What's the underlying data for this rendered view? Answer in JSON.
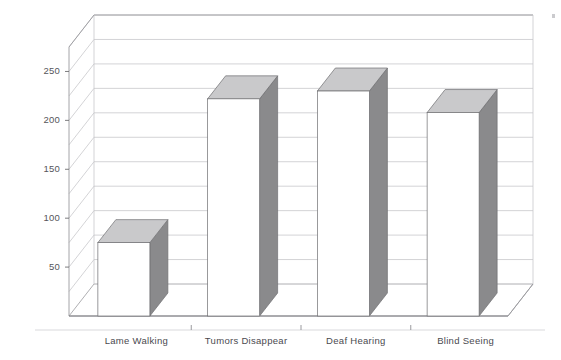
{
  "chart_data": {
    "type": "bar",
    "title": "",
    "xlabel": "",
    "ylabel": "",
    "categories": [
      "Lame Walking",
      "Tumors Disappear",
      "Deaf Hearing",
      "Blind Seeing"
    ],
    "values": [
      75,
      222,
      230,
      208
    ],
    "ylim": [
      0,
      275
    ],
    "yticks": [
      50,
      100,
      150,
      200,
      250
    ],
    "ytick_labels": [
      "50",
      "100",
      "150",
      "200",
      "250"
    ],
    "gridlines": [
      25,
      50,
      75,
      100,
      125,
      150,
      175,
      200,
      225,
      250,
      275
    ],
    "grid": true,
    "legend": "none",
    "style": "3d-column",
    "colors": {
      "bar_front": "#ffffff",
      "bar_top": "#c9c9cb",
      "bar_side": "#8a8a8c",
      "bar_outline": "#6e6e71",
      "grid": "#c8c8cc",
      "axis": "#9a9a9e",
      "floor": "#ffffff",
      "text": "#55555a"
    }
  },
  "axis": {
    "ticks": [
      {
        "label": "250",
        "value": 250
      },
      {
        "label": "200",
        "value": 200
      },
      {
        "label": "150",
        "value": 150
      },
      {
        "label": "100",
        "value": 100
      },
      {
        "label": "50",
        "value": 50
      }
    ]
  },
  "categories": [
    {
      "label": "Lame Walking",
      "value": 75
    },
    {
      "label": "Tumors Disappear",
      "value": 222
    },
    {
      "label": "Deaf Hearing",
      "value": 230
    },
    {
      "label": "Blind Seeing",
      "value": 208
    }
  ],
  "title": {
    "text": ""
  }
}
